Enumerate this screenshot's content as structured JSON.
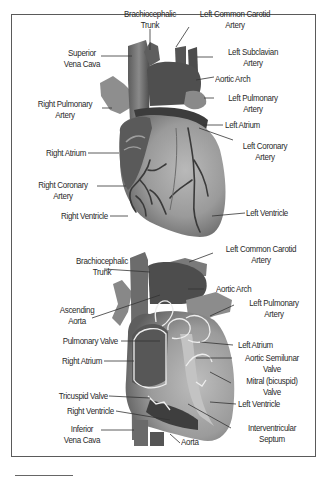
{
  "figure": {
    "top_heart": {
      "view": "exterior anterior",
      "labels": [
        {
          "id": "brachiocephalic-trunk",
          "text": "Brachiocephalic\nTrunk"
        },
        {
          "id": "left-common-carotid-artery",
          "text": "Left Common Carotid\nArtery"
        },
        {
          "id": "superior-vena-cava",
          "text": "Superior\nVena Cava"
        },
        {
          "id": "left-subclavian-artery",
          "text": "Left Subclavian\nArtery"
        },
        {
          "id": "aortic-arch",
          "text": "Aortic Arch"
        },
        {
          "id": "right-pulmonary-artery",
          "text": "Right Pulmonary\nArtery"
        },
        {
          "id": "left-pulmonary-artery",
          "text": "Left Pulmonary\nArtery"
        },
        {
          "id": "left-atrium",
          "text": "Left Atrium"
        },
        {
          "id": "right-atrium",
          "text": "Right Atrium"
        },
        {
          "id": "left-coronary-artery",
          "text": "Left Coronary\nArtery"
        },
        {
          "id": "right-coronary-artery",
          "text": "Right Coronary\nArtery"
        },
        {
          "id": "right-ventricle",
          "text": "Right Ventricle"
        },
        {
          "id": "left-ventricle",
          "text": "Left Ventricle"
        }
      ]
    },
    "bottom_heart": {
      "view": "interior cross-section",
      "labels": [
        {
          "id": "brachiocephalic-trunk",
          "text": "Brachiocephalic\nTrunk"
        },
        {
          "id": "left-common-carotid-artery",
          "text": "Left Common Carotid\nArtery"
        },
        {
          "id": "aortic-arch",
          "text": "Aortic Arch"
        },
        {
          "id": "ascending-aorta",
          "text": "Ascending\nAorta"
        },
        {
          "id": "left-pulmonary-artery",
          "text": "Left Pulmonary\nArtery"
        },
        {
          "id": "pulmonary-valve",
          "text": "Pulmonary Valve"
        },
        {
          "id": "left-atrium",
          "text": "Left Atrium"
        },
        {
          "id": "right-atrium",
          "text": "Right Atrium"
        },
        {
          "id": "aortic-semilunar-valve",
          "text": "Aortic Semilunar\nValve"
        },
        {
          "id": "mitral-valve",
          "text": "Mitral (bicuspid)\nValve"
        },
        {
          "id": "tricuspid-valve",
          "text": "Tricuspid Valve"
        },
        {
          "id": "left-ventricle",
          "text": "Left Ventricle"
        },
        {
          "id": "right-ventricle",
          "text": "Right Ventricle"
        },
        {
          "id": "inferior-vena-cava",
          "text": "Inferior\nVena Cava"
        },
        {
          "id": "interventricular-septum",
          "text": "Interventricular\nSeptum"
        },
        {
          "id": "aorta",
          "text": "Aorta"
        }
      ]
    }
  },
  "colors": {
    "frame": "#5a5a5a",
    "text": "#2a2a2a",
    "leader": "#333333",
    "heart_light": "#a8a8a8",
    "heart_mid": "#7a7a7a",
    "heart_dark": "#3c3c3c",
    "vessel_line": "#e8e8e8"
  }
}
